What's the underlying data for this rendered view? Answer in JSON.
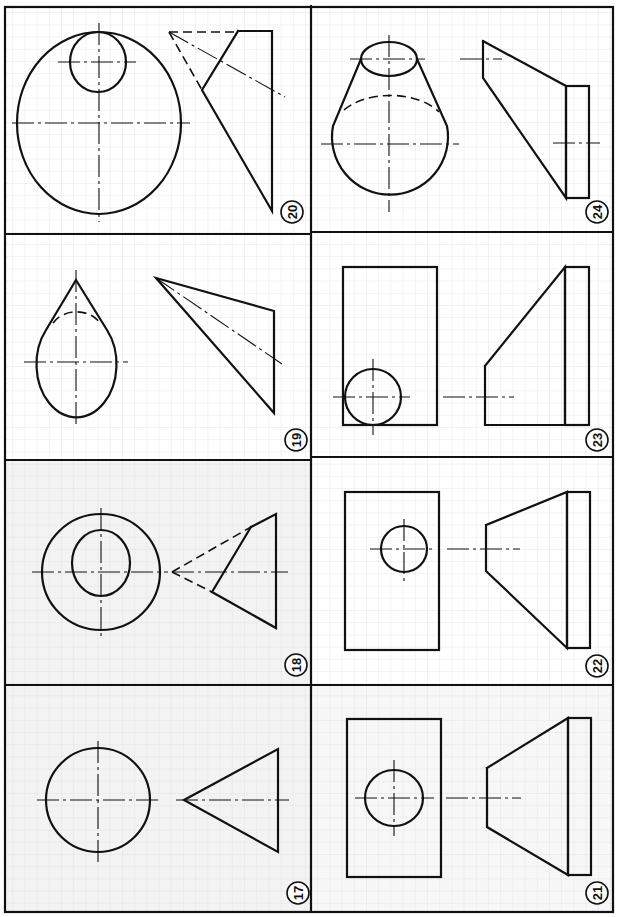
{
  "sheet": {
    "title": "Orthographic projection exercises 17–24",
    "grid_color": "#d9d9d9",
    "paper_color": "#ffffff",
    "shaded_panel_color": "#f2f2f2",
    "ink_color": "#111111"
  },
  "panels": [
    {
      "id": "20",
      "label": "20",
      "description": "Large circle with small offset circle; side view is a skewed triangle with hidden lines"
    },
    {
      "id": "24",
      "label": "24",
      "description": "Truncated cone tangent to sphere-like circle; side view trapezoid with rectangle"
    },
    {
      "id": "19",
      "label": "19",
      "description": "Teardrop (cone tangent to circle) with hidden arc; side view triangle"
    },
    {
      "id": "23",
      "label": "23",
      "description": "Rectangle with circle at lower-left corner; side view trapezoid with rectangle"
    },
    {
      "id": "18",
      "label": "18",
      "description": "Concentric circles; side view triangle with hidden lines"
    },
    {
      "id": "22",
      "label": "22",
      "description": "Rectangle with upper circle; side view frustum with rectangle"
    },
    {
      "id": "17",
      "label": "17",
      "description": "Circle with centerlines; side view triangle (cone)"
    },
    {
      "id": "21",
      "label": "21",
      "description": "Rectangle with centered circle; side view frustum with rectangle"
    }
  ]
}
